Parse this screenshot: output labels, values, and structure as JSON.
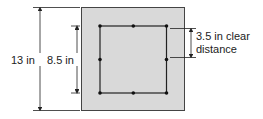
{
  "diagram": {
    "labels": {
      "outer_dimension": "13 in",
      "inner_dimension": "8.5 in",
      "clear_distance_line1": "3.5 in clear",
      "clear_distance_line2": "distance"
    },
    "colors": {
      "section_fill": "#d9d9d9",
      "lines": "#222222",
      "bars": "#111111"
    },
    "bar_count": 8
  }
}
